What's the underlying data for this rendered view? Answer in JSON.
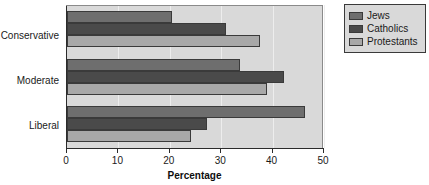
{
  "chart_data": {
    "type": "bar",
    "orientation": "horizontal",
    "title": "",
    "xlabel": "Percentage",
    "ylabel": "",
    "xlim": [
      0,
      50
    ],
    "xticks": [
      0,
      10,
      20,
      30,
      40,
      50
    ],
    "xtick_labels": [
      "0",
      "10",
      "20",
      "30",
      "40",
      "50"
    ],
    "grid": true,
    "legend_position": "top-right",
    "categories": [
      "Conservative",
      "Moderate",
      "Liberal"
    ],
    "series": [
      {
        "name": "Jews",
        "color": "#6e6e6e",
        "values": [
          20.5,
          33.6,
          46.3
        ]
      },
      {
        "name": "Catholics",
        "color": "#4a4a4a",
        "values": [
          31.0,
          42.2,
          27.2
        ]
      },
      {
        "name": "Protestants",
        "color": "#a8a8a8",
        "values": [
          37.5,
          39.0,
          24.2
        ]
      }
    ],
    "plot_background": "#d9d9d9",
    "page_background": "#ffffff"
  },
  "legend": {
    "items": [
      {
        "label": "Jews"
      },
      {
        "label": "Catholics"
      },
      {
        "label": "Protestants"
      }
    ]
  },
  "axis": {
    "x_title": "Percentage"
  }
}
